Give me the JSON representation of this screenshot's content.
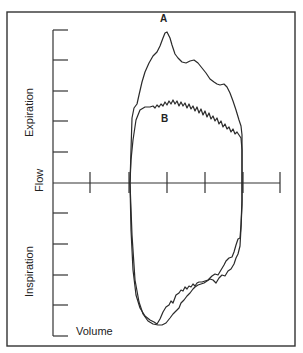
{
  "diagram": {
    "type": "flow-volume loop",
    "labels": {
      "y_axis": "Flow",
      "x_axis": "Volume",
      "upper_region": "Expiration",
      "lower_region": "Inspiration",
      "curve_a": "A",
      "curve_b": "B"
    },
    "axes": {
      "y_ticks_upper": 5,
      "y_ticks_lower": 5,
      "x_ticks": 6
    },
    "curves": [
      {
        "name": "A",
        "description": "Normal expiratory peak flow loop (higher peak)"
      },
      {
        "name": "B",
        "description": "Reduced, flattened, oscillating expiratory flow loop"
      }
    ]
  }
}
